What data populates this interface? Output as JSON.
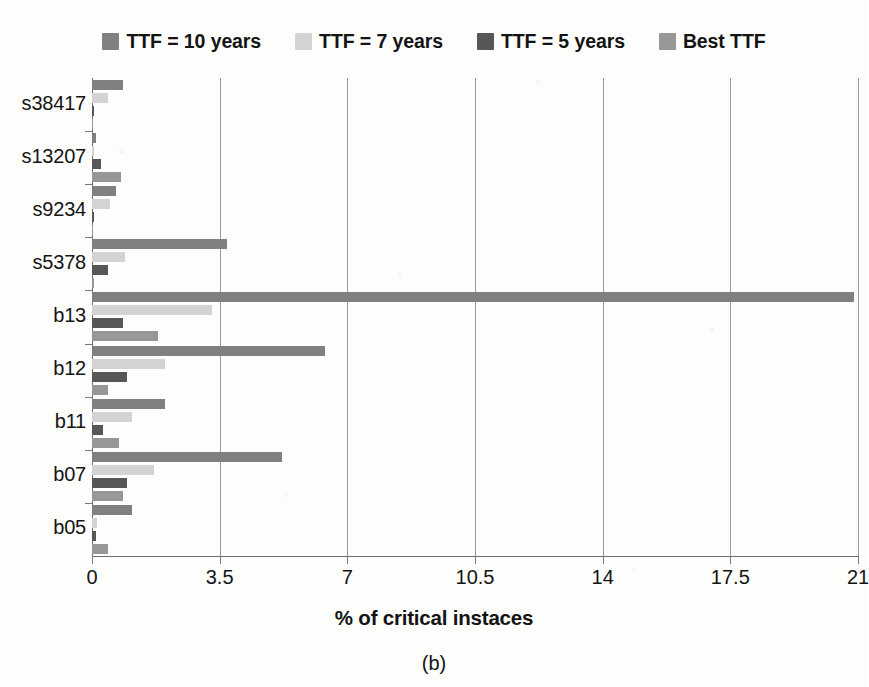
{
  "legend": {
    "entries": [
      {
        "label": "TTF = 10 years",
        "color": "#808080",
        "icon": "legend-swatch-icon"
      },
      {
        "label": "TTF = 7 years",
        "color": "#d3d3d3",
        "icon": "legend-swatch-icon"
      },
      {
        "label": "TTF = 5 years",
        "color": "#575757",
        "icon": "legend-swatch-icon"
      },
      {
        "label": "Best TTF",
        "color": "#979797",
        "icon": "legend-swatch-icon"
      }
    ]
  },
  "caption": "(b)",
  "axis": {
    "x_title": "% of critical instaces",
    "x_ticks": [
      "0",
      "3.5",
      "7",
      "10.5",
      "14",
      "17.5",
      "21"
    ]
  },
  "chart_data": {
    "type": "bar",
    "orientation": "horizontal",
    "title": "",
    "subtitle": "",
    "xlabel": "% of critical instaces",
    "ylabel": "",
    "xlim": [
      0,
      21
    ],
    "xticks": [
      0,
      3.5,
      7,
      10.5,
      14,
      17.5,
      21
    ],
    "grid": "vertical",
    "legend_position": "top",
    "categories": [
      "s38417",
      "s13207",
      "s9234",
      "s5378",
      "b13",
      "b12",
      "b11",
      "b07",
      "b05"
    ],
    "category_order_top_to_bottom": [
      "s38417",
      "s13207",
      "s9234",
      "s5378",
      "b13",
      "b12",
      "b11",
      "b07",
      "b05"
    ],
    "series": [
      {
        "name": "TTF = 10 years",
        "color": "#808080",
        "values": [
          0.85,
          0.1,
          0.65,
          3.7,
          20.9,
          6.4,
          2.0,
          5.2,
          1.1
        ]
      },
      {
        "name": "TTF = 7 years",
        "color": "#d3d3d3",
        "values": [
          0.45,
          0.05,
          0.5,
          0.9,
          3.3,
          2.0,
          1.1,
          1.7,
          0.15
        ]
      },
      {
        "name": "TTF = 5 years",
        "color": "#575757",
        "values": [
          0.05,
          0.25,
          0.05,
          0.45,
          0.85,
          0.95,
          0.3,
          0.95,
          0.1
        ]
      },
      {
        "name": "Best TTF",
        "color": "#979797",
        "values": [
          0.0,
          0.8,
          0.0,
          0.05,
          1.8,
          0.45,
          0.75,
          0.85,
          0.45
        ]
      }
    ]
  }
}
